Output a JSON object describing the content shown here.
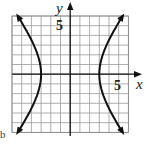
{
  "chart_data": {
    "type": "line",
    "title": "",
    "xlabel": "x",
    "ylabel": "y",
    "xlim": [
      -6,
      6
    ],
    "ylim": [
      -6,
      6
    ],
    "grid": true,
    "tick_labels": {
      "x": [
        "5"
      ],
      "y": [
        "5"
      ]
    },
    "series": [
      {
        "name": "hyperbola-left-branch",
        "equation": "x^2/9 - y^2/16 = 1",
        "vertex": [
          -3,
          0
        ],
        "points": [
          [
            -5.41,
            6
          ],
          [
            -4.5,
            4.47
          ],
          [
            -3.75,
            3
          ],
          [
            -3.2,
            1.5
          ],
          [
            -3,
            0
          ],
          [
            -3.2,
            -1.5
          ],
          [
            -3.75,
            -3
          ],
          [
            -4.5,
            -4.47
          ],
          [
            -5.41,
            -6
          ]
        ]
      },
      {
        "name": "hyperbola-right-branch",
        "equation": "x^2/9 - y^2/16 = 1",
        "vertex": [
          3,
          0
        ],
        "points": [
          [
            5.41,
            6
          ],
          [
            4.5,
            4.47
          ],
          [
            3.75,
            3
          ],
          [
            3.2,
            1.5
          ],
          [
            3,
            0
          ],
          [
            3.2,
            -1.5
          ],
          [
            3.75,
            -3
          ],
          [
            4.5,
            -4.47
          ],
          [
            5.41,
            -6
          ]
        ]
      }
    ]
  },
  "labels": {
    "x_axis": "x",
    "y_axis": "y",
    "x_tick": "5",
    "y_tick": "5",
    "side_mark": "b"
  }
}
